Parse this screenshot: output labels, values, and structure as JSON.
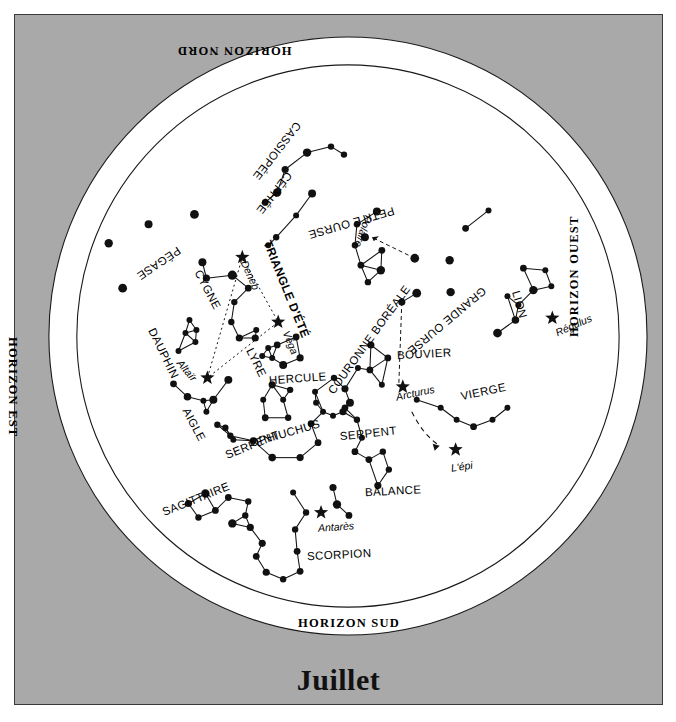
{
  "chart_data": {
    "type": "scatter",
    "title": "Juillet",
    "subtitle": "Carte du ciel - constellations visibles",
    "xlabel": "",
    "ylabel": "",
    "grid": false,
    "legend_position": "none",
    "projection": "planisphere / circular sky map",
    "center": {
      "x": 348,
      "y": 336
    },
    "outer_radius": 300,
    "inner_radius": 272,
    "horizons": [
      {
        "name": "HORIZON NORD",
        "position": "top",
        "rotation": 180
      },
      {
        "name": "HORIZON EST",
        "position": "left",
        "rotation": 90
      },
      {
        "name": "HORIZON OUEST",
        "position": "right",
        "rotation": -90
      },
      {
        "name": "HORIZON SUD",
        "position": "bottom",
        "rotation": 0
      }
    ],
    "constellations": [
      {
        "name": "PÉGASE",
        "x": 178,
        "y": 248,
        "rotation": -214,
        "style": "const"
      },
      {
        "name": "CASSIOPÉE",
        "x": 297,
        "y": 122,
        "rotation": -232,
        "style": "const"
      },
      {
        "name": "CÉPHÉE",
        "x": 288,
        "y": 172,
        "rotation": -232,
        "style": "const"
      },
      {
        "name": "PETITE OURSE",
        "x": 393,
        "y": 209,
        "rotation": -196,
        "style": "const"
      },
      {
        "name": "GRANDE OURSE",
        "x": 483,
        "y": 288,
        "rotation": -220,
        "style": "const"
      },
      {
        "name": "CYGNE",
        "x": 196,
        "y": 270,
        "rotation": 62,
        "style": "const"
      },
      {
        "name": "DAUPHIN",
        "x": 150,
        "y": 328,
        "rotation": 64,
        "style": "const"
      },
      {
        "name": "AIGLE",
        "x": 184,
        "y": 408,
        "rotation": 62,
        "style": "const"
      },
      {
        "name": "LYRE",
        "x": 248,
        "y": 348,
        "rotation": 64,
        "style": "const"
      },
      {
        "name": "TRIANGLE D'ÉTÉ",
        "x": 266,
        "y": 240,
        "rotation": 68,
        "style": "tri"
      },
      {
        "name": "HERCULE",
        "x": 268,
        "y": 380,
        "rotation": -4,
        "style": "const"
      },
      {
        "name": "COURONNE BORÉALE",
        "x": 330,
        "y": 392,
        "rotation": -54,
        "style": "const"
      },
      {
        "name": "BOUVIER",
        "x": 396,
        "y": 355,
        "rotation": -3,
        "style": "const"
      },
      {
        "name": "SERPENT",
        "x": 339,
        "y": 436,
        "rotation": -6,
        "style": "const"
      },
      {
        "name": "OPHIUCHUS",
        "x": 249,
        "y": 443,
        "rotation": -16,
        "style": "const"
      },
      {
        "name": "SERPENT",
        "x": 225,
        "y": 455,
        "rotation": -22,
        "style": "const"
      },
      {
        "name": "SAGITTAIRE",
        "x": 162,
        "y": 512,
        "rotation": -22,
        "style": "const"
      },
      {
        "name": "SCORPION",
        "x": 306,
        "y": 556,
        "rotation": -3,
        "style": "const"
      },
      {
        "name": "BALANCE",
        "x": 364,
        "y": 492,
        "rotation": -3,
        "style": "const"
      },
      {
        "name": "VIERGE",
        "x": 460,
        "y": 396,
        "rotation": -12,
        "style": "const"
      },
      {
        "name": "LION",
        "x": 514,
        "y": 290,
        "rotation": 74,
        "style": "const"
      }
    ],
    "named_stars": [
      {
        "name": "Deneb",
        "x": 243,
        "y": 260,
        "sx": 242,
        "sy": 257,
        "rotation": 66,
        "bright": true
      },
      {
        "name": "Véga",
        "x": 285,
        "y": 330,
        "sx": 278,
        "sy": 322,
        "rotation": 68,
        "bright": true
      },
      {
        "name": "Altaïr",
        "x": 178,
        "y": 360,
        "sx": 207,
        "sy": 378,
        "rotation": 50,
        "bright": true
      },
      {
        "name": "Polaire",
        "x": 368,
        "y": 215,
        "sx": 365,
        "sy": 237,
        "rotation": -250,
        "bright": false
      },
      {
        "name": "Arcturus",
        "x": 395,
        "y": 396,
        "sx": 403,
        "sy": 387,
        "rotation": -12,
        "bright": true
      },
      {
        "name": "Antarès",
        "x": 317,
        "y": 527,
        "sx": 321,
        "sy": 513,
        "rotation": -4,
        "bright": true
      },
      {
        "name": "Régulus",
        "x": 555,
        "y": 332,
        "sx": 553,
        "sy": 318,
        "rotation": -24,
        "bright": true
      },
      {
        "name": "L'épi",
        "x": 450,
        "y": 467,
        "sx": 456,
        "sy": 450,
        "rotation": -8,
        "bright": true
      }
    ],
    "stars": [
      {
        "x": 108,
        "y": 243,
        "r": 4.2
      },
      {
        "x": 148,
        "y": 224,
        "r": 4.0
      },
      {
        "x": 194,
        "y": 214,
        "r": 4.4
      },
      {
        "x": 202,
        "y": 262,
        "r": 4.0
      },
      {
        "x": 122,
        "y": 288,
        "r": 4.4
      },
      {
        "x": 307,
        "y": 152,
        "r": 4.2
      },
      {
        "x": 331,
        "y": 146,
        "r": 3.2
      },
      {
        "x": 344,
        "y": 154,
        "r": 3.2
      },
      {
        "x": 285,
        "y": 169,
        "r": 3.6
      },
      {
        "x": 277,
        "y": 192,
        "r": 4.2
      },
      {
        "x": 265,
        "y": 202,
        "r": 3.4
      },
      {
        "x": 276,
        "y": 237,
        "r": 3.2
      },
      {
        "x": 296,
        "y": 215,
        "r": 3.0
      },
      {
        "x": 312,
        "y": 193,
        "r": 4.0
      },
      {
        "x": 268,
        "y": 245,
        "r": 3.0
      },
      {
        "x": 377,
        "y": 211,
        "r": 4.0
      },
      {
        "x": 357,
        "y": 224,
        "r": 3.2
      },
      {
        "x": 355,
        "y": 245,
        "r": 3.2
      },
      {
        "x": 361,
        "y": 265,
        "r": 3.4
      },
      {
        "x": 381,
        "y": 270,
        "r": 4.2
      },
      {
        "x": 382,
        "y": 250,
        "r": 3.4
      },
      {
        "x": 368,
        "y": 282,
        "r": 3.2
      },
      {
        "x": 415,
        "y": 258,
        "r": 4.4
      },
      {
        "x": 450,
        "y": 260,
        "r": 4.2
      },
      {
        "x": 417,
        "y": 293,
        "r": 4.4
      },
      {
        "x": 451,
        "y": 292,
        "r": 4.2
      },
      {
        "x": 402,
        "y": 302,
        "r": 3.6
      },
      {
        "x": 466,
        "y": 228,
        "r": 3.4
      },
      {
        "x": 489,
        "y": 210,
        "r": 3.0
      },
      {
        "x": 232,
        "y": 275,
        "r": 4.6
      },
      {
        "x": 206,
        "y": 278,
        "r": 3.6
      },
      {
        "x": 248,
        "y": 288,
        "r": 3.4
      },
      {
        "x": 234,
        "y": 302,
        "r": 3.2
      },
      {
        "x": 231,
        "y": 322,
        "r": 3.2
      },
      {
        "x": 239,
        "y": 338,
        "r": 3.6
      },
      {
        "x": 256,
        "y": 330,
        "r": 3.0
      },
      {
        "x": 189,
        "y": 320,
        "r": 3.0
      },
      {
        "x": 196,
        "y": 330,
        "r": 3.0
      },
      {
        "x": 185,
        "y": 333,
        "r": 3.0
      },
      {
        "x": 195,
        "y": 342,
        "r": 3.0
      },
      {
        "x": 178,
        "y": 351,
        "r": 3.0
      },
      {
        "x": 228,
        "y": 380,
        "r": 4.0
      },
      {
        "x": 187,
        "y": 397,
        "r": 3.8
      },
      {
        "x": 173,
        "y": 384,
        "r": 3.4
      },
      {
        "x": 213,
        "y": 400,
        "r": 4.0
      },
      {
        "x": 225,
        "y": 428,
        "r": 3.2
      },
      {
        "x": 233,
        "y": 440,
        "r": 3.0
      },
      {
        "x": 255,
        "y": 338,
        "r": 3.6
      },
      {
        "x": 268,
        "y": 348,
        "r": 3.0
      },
      {
        "x": 262,
        "y": 356,
        "r": 3.0
      },
      {
        "x": 272,
        "y": 358,
        "r": 3.0
      },
      {
        "x": 277,
        "y": 345,
        "r": 3.4
      },
      {
        "x": 296,
        "y": 337,
        "r": 3.4
      },
      {
        "x": 300,
        "y": 358,
        "r": 3.6
      },
      {
        "x": 283,
        "y": 365,
        "r": 4.0
      },
      {
        "x": 272,
        "y": 385,
        "r": 3.6
      },
      {
        "x": 290,
        "y": 390,
        "r": 3.2
      },
      {
        "x": 283,
        "y": 400,
        "r": 3.0
      },
      {
        "x": 263,
        "y": 400,
        "r": 3.0
      },
      {
        "x": 334,
        "y": 378,
        "r": 3.2
      },
      {
        "x": 345,
        "y": 389,
        "r": 3.6
      },
      {
        "x": 350,
        "y": 403,
        "r": 4.0
      },
      {
        "x": 343,
        "y": 412,
        "r": 3.6
      },
      {
        "x": 333,
        "y": 416,
        "r": 3.0
      },
      {
        "x": 323,
        "y": 412,
        "r": 3.0
      },
      {
        "x": 316,
        "y": 403,
        "r": 3.0
      },
      {
        "x": 315,
        "y": 392,
        "r": 3.0
      },
      {
        "x": 371,
        "y": 345,
        "r": 3.6
      },
      {
        "x": 388,
        "y": 358,
        "r": 3.4
      },
      {
        "x": 370,
        "y": 370,
        "r": 3.4
      },
      {
        "x": 382,
        "y": 385,
        "r": 3.0
      },
      {
        "x": 358,
        "y": 368,
        "r": 3.0
      },
      {
        "x": 345,
        "y": 408,
        "r": 3.4
      },
      {
        "x": 357,
        "y": 420,
        "r": 3.2
      },
      {
        "x": 362,
        "y": 438,
        "r": 3.0
      },
      {
        "x": 355,
        "y": 452,
        "r": 3.4
      },
      {
        "x": 369,
        "y": 460,
        "r": 3.4
      },
      {
        "x": 383,
        "y": 452,
        "r": 3.2
      },
      {
        "x": 389,
        "y": 470,
        "r": 3.2
      },
      {
        "x": 378,
        "y": 486,
        "r": 3.6
      },
      {
        "x": 265,
        "y": 418,
        "r": 3.4
      },
      {
        "x": 288,
        "y": 418,
        "r": 3.2
      },
      {
        "x": 311,
        "y": 424,
        "r": 3.4
      },
      {
        "x": 318,
        "y": 443,
        "r": 3.4
      },
      {
        "x": 300,
        "y": 458,
        "r": 3.6
      },
      {
        "x": 272,
        "y": 458,
        "r": 3.8
      },
      {
        "x": 253,
        "y": 441,
        "r": 3.4
      },
      {
        "x": 230,
        "y": 436,
        "r": 3.2
      },
      {
        "x": 217,
        "y": 425,
        "r": 3.2
      },
      {
        "x": 206,
        "y": 412,
        "r": 3.0
      },
      {
        "x": 203,
        "y": 401,
        "r": 3.0
      },
      {
        "x": 188,
        "y": 504,
        "r": 3.6
      },
      {
        "x": 205,
        "y": 494,
        "r": 4.2
      },
      {
        "x": 215,
        "y": 511,
        "r": 3.4
      },
      {
        "x": 228,
        "y": 498,
        "r": 3.4
      },
      {
        "x": 232,
        "y": 524,
        "r": 4.2
      },
      {
        "x": 245,
        "y": 516,
        "r": 3.2
      },
      {
        "x": 250,
        "y": 528,
        "r": 3.6
      },
      {
        "x": 198,
        "y": 518,
        "r": 3.2
      },
      {
        "x": 248,
        "y": 502,
        "r": 3.2
      },
      {
        "x": 333,
        "y": 488,
        "r": 3.6
      },
      {
        "x": 337,
        "y": 505,
        "r": 4.2
      },
      {
        "x": 349,
        "y": 516,
        "r": 3.4
      },
      {
        "x": 306,
        "y": 513,
        "r": 3.2
      },
      {
        "x": 295,
        "y": 530,
        "r": 3.2
      },
      {
        "x": 297,
        "y": 552,
        "r": 3.4
      },
      {
        "x": 300,
        "y": 572,
        "r": 3.4
      },
      {
        "x": 283,
        "y": 580,
        "r": 3.2
      },
      {
        "x": 266,
        "y": 573,
        "r": 3.6
      },
      {
        "x": 256,
        "y": 557,
        "r": 3.4
      },
      {
        "x": 262,
        "y": 544,
        "r": 3.6
      },
      {
        "x": 293,
        "y": 493,
        "r": 3.0
      },
      {
        "x": 441,
        "y": 408,
        "r": 3.0
      },
      {
        "x": 457,
        "y": 420,
        "r": 3.0
      },
      {
        "x": 474,
        "y": 427,
        "r": 3.4
      },
      {
        "x": 493,
        "y": 420,
        "r": 3.0
      },
      {
        "x": 508,
        "y": 408,
        "r": 3.0
      },
      {
        "x": 417,
        "y": 400,
        "r": 3.0
      },
      {
        "x": 524,
        "y": 268,
        "r": 3.4
      },
      {
        "x": 534,
        "y": 290,
        "r": 4.2
      },
      {
        "x": 546,
        "y": 270,
        "r": 3.0
      },
      {
        "x": 552,
        "y": 286,
        "r": 3.0
      },
      {
        "x": 516,
        "y": 320,
        "r": 3.8
      },
      {
        "x": 498,
        "y": 333,
        "r": 4.4
      },
      {
        "x": 508,
        "y": 296,
        "r": 3.0
      },
      {
        "x": 519,
        "y": 305,
        "r": 3.0
      }
    ],
    "annotations": [
      {
        "text": "dashed pointer from Grande Ourse to Polaire",
        "type": "arrow"
      },
      {
        "text": "dashed arc from Arcturus to L'épi",
        "type": "arrow"
      },
      {
        "text": "Triangle d'été: Deneb – Véga – Altaïr (dotted triangle)",
        "type": "guide"
      }
    ]
  },
  "page": {
    "month_label": "Juillet"
  }
}
